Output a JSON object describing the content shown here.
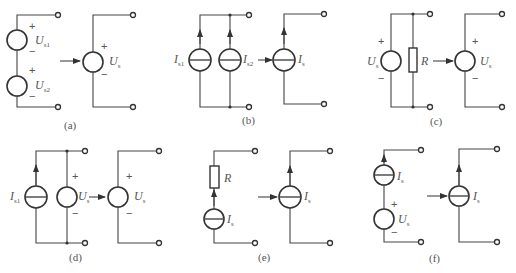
{
  "figure": {
    "panels": [
      {
        "id": "a",
        "caption": "(a)",
        "description": "Series voltage sources Us1 and Us2 equivalent to single voltage source Us",
        "labels": {
          "src1": {
            "main": "U",
            "sub": "s1"
          },
          "src2": {
            "main": "U",
            "sub": "s2"
          },
          "result": {
            "main": "U",
            "sub": "s"
          }
        }
      },
      {
        "id": "b",
        "caption": "(b)",
        "description": "Parallel current sources Is1 and Is2 equivalent to single current source Is",
        "labels": {
          "src1": {
            "main": "I",
            "sub": "s1"
          },
          "src2": {
            "main": "I",
            "sub": "s2"
          },
          "result": {
            "main": "I",
            "sub": "s"
          }
        }
      },
      {
        "id": "c",
        "caption": "(c)",
        "description": "Voltage source Us in parallel with resistor R equivalent to voltage source Us",
        "labels": {
          "src": {
            "main": "U",
            "sub": "s"
          },
          "resistor": "R",
          "result": {
            "main": "U",
            "sub": "s"
          }
        }
      },
      {
        "id": "d",
        "caption": "(d)",
        "description": "Current source Is1 in parallel with voltage source Us equivalent to voltage source Us",
        "labels": {
          "src1": {
            "main": "I",
            "sub": "s1"
          },
          "src2": {
            "main": "U",
            "sub": "s"
          },
          "result": {
            "main": "U",
            "sub": "s"
          }
        }
      },
      {
        "id": "e",
        "caption": "(e)",
        "description": "Current source Is in series with resistor R equivalent to current source Is",
        "labels": {
          "resistor": "R",
          "src": {
            "main": "I",
            "sub": "s"
          },
          "result": {
            "main": "I",
            "sub": "s"
          }
        }
      },
      {
        "id": "f",
        "caption": "(f)",
        "description": "Current source Is in series with voltage source Us equivalent to current source Is",
        "labels": {
          "src1": {
            "main": "I",
            "sub": "s"
          },
          "src2": {
            "main": "U",
            "sub": "s"
          },
          "result": {
            "main": "I",
            "sub": "s"
          }
        }
      }
    ],
    "plus": "+",
    "minus": "−"
  }
}
